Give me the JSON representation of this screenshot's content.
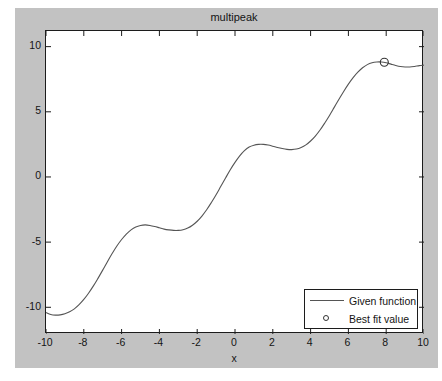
{
  "figure": {
    "background_color": "#c2c2c2",
    "page_background_color": "#ffffff",
    "axes_background_color": "#ffffff",
    "axes_border_color": "#1c1c1c"
  },
  "chart_data": {
    "type": "line",
    "title": "multipeak",
    "xlabel": "x",
    "ylabel": "",
    "xlim": [
      -10,
      10
    ],
    "ylim": [
      -12.05,
      11.2
    ],
    "grid": false,
    "legend_position": "lower right",
    "xticks": [
      -10,
      -8,
      -6,
      -4,
      -2,
      0,
      2,
      4,
      6,
      8,
      10
    ],
    "xtick_labels": [
      "-10",
      "-8",
      "-6",
      "-4",
      "-2",
      "0",
      "2",
      "4",
      "6",
      "8",
      "10"
    ],
    "yticks": [
      -10,
      -5,
      0,
      5,
      10
    ],
    "ytick_labels": [
      "-10",
      "-5",
      "0",
      "5",
      "10"
    ],
    "series": [
      {
        "name": "Given function",
        "type": "line",
        "color": "#555555",
        "x": [
          -10,
          -9.75,
          -9.5,
          -9.25,
          -9,
          -8.75,
          -8.5,
          -8.25,
          -8,
          -7.75,
          -7.5,
          -7.25,
          -7,
          -6.75,
          -6.5,
          -6.25,
          -6,
          -5.75,
          -5.5,
          -5.25,
          -5,
          -4.75,
          -4.5,
          -4.25,
          -4,
          -3.75,
          -3.5,
          -3.25,
          -3,
          -2.75,
          -2.5,
          -2.25,
          -2,
          -1.75,
          -1.5,
          -1.25,
          -1,
          -0.75,
          -0.5,
          -0.25,
          0,
          0.25,
          0.5,
          0.75,
          1,
          1.25,
          1.5,
          1.75,
          2,
          2.25,
          2.5,
          2.75,
          3,
          3.25,
          3.5,
          3.75,
          4,
          4.25,
          4.5,
          4.75,
          5,
          5.25,
          5.5,
          5.75,
          6,
          6.25,
          6.5,
          6.75,
          7,
          7.25,
          7.5,
          7.75,
          8,
          8.25,
          8.5,
          8.75,
          9,
          9.25,
          9.5,
          9.75,
          10
        ],
        "y": [
          -10.4,
          -10.55,
          -10.6,
          -10.58,
          -10.5,
          -10.35,
          -10.12,
          -9.8,
          -9.4,
          -8.92,
          -8.38,
          -7.78,
          -7.15,
          -6.5,
          -5.88,
          -5.3,
          -4.8,
          -4.38,
          -4.06,
          -3.84,
          -3.72,
          -3.68,
          -3.72,
          -3.8,
          -3.9,
          -4,
          -4.06,
          -4.1,
          -4.1,
          -4.05,
          -3.92,
          -3.7,
          -3.4,
          -3.0,
          -2.52,
          -1.96,
          -1.36,
          -0.72,
          -0.08,
          0.55,
          1.12,
          1.62,
          2.02,
          2.3,
          2.44,
          2.5,
          2.5,
          2.45,
          2.36,
          2.26,
          2.18,
          2.12,
          2.1,
          2.14,
          2.26,
          2.46,
          2.76,
          3.14,
          3.6,
          4.14,
          4.72,
          5.34,
          5.96,
          6.56,
          7.12,
          7.62,
          8.04,
          8.38,
          8.62,
          8.76,
          8.82,
          8.82,
          8.76,
          8.66,
          8.56,
          8.48,
          8.44,
          8.44,
          8.48,
          8.54,
          8.58
        ]
      },
      {
        "name": "Best fit value",
        "type": "scatter",
        "marker": "circle",
        "color": "#333333",
        "points": [
          {
            "x": 7.9,
            "y": 8.8
          }
        ]
      }
    ]
  },
  "legend": {
    "entries": [
      {
        "label": "Given function",
        "glyph": "line"
      },
      {
        "label": "Best fit value",
        "glyph": "circle-marker"
      }
    ]
  }
}
